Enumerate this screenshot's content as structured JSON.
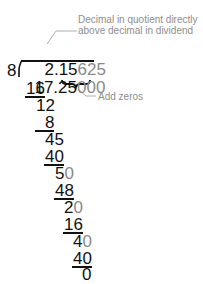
{
  "problem": {
    "divisor": "8",
    "dividend_main": "17.25",
    "dividend_added": "000",
    "quotient_main": "2.15",
    "quotient_added": "625"
  },
  "annotations": {
    "decimal_note_line1": "Decimal in quotient directly",
    "decimal_note_line2": "above decimal in dividend",
    "zeros_note": "Add zeros"
  },
  "steps": [
    {
      "subtract": "16",
      "remainder_main": "1",
      "remainder_rest": "2",
      "remainder_added": ""
    },
    {
      "subtract": "8",
      "remainder_main": "45",
      "remainder_added": ""
    },
    {
      "subtract": "40",
      "remainder_main": "5",
      "remainder_added": "0"
    },
    {
      "subtract": "48",
      "remainder_main": "2",
      "remainder_added": "0"
    },
    {
      "subtract": "16",
      "remainder_main": "4",
      "remainder_added": "0"
    },
    {
      "subtract": "40",
      "remainder_main": "0",
      "remainder_added": ""
    }
  ],
  "colors": {
    "original_digits": "#111111",
    "added_digits": "#8a8a8a",
    "annotation_text": "#8e8e8e"
  }
}
